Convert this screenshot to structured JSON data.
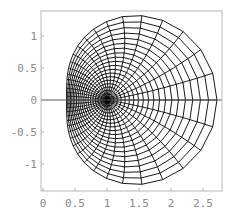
{
  "chart_data": {
    "type": "line",
    "title": "",
    "xlabel": "",
    "ylabel": "",
    "xlim": [
      -0.03,
      2.8
    ],
    "ylim": [
      -1.42,
      1.39
    ],
    "x_ticks": [
      0,
      0.5,
      1,
      1.5,
      2,
      2.5
    ],
    "x_tick_labels": [
      "0",
      "0.5",
      "1",
      "1.5",
      "2",
      "2.5"
    ],
    "y_ticks": [
      1,
      0.5,
      0,
      -0.5,
      -1
    ],
    "y_tick_labels": [
      "1",
      "0.5",
      "0",
      "-0.5",
      "-1"
    ],
    "grid": false,
    "legend": null,
    "mesh": {
      "map": "exp",
      "radius_max": 1.0,
      "num_circles": 20,
      "num_radial_lines": 40,
      "center_image": [
        1,
        0
      ],
      "extent": {
        "left": 0.368,
        "right": 2.718,
        "top": 1.32,
        "bottom": -1.32
      }
    },
    "line_color": "#000000",
    "frame_color": "#b8b8b8",
    "label_color": "#8a8a8a"
  }
}
